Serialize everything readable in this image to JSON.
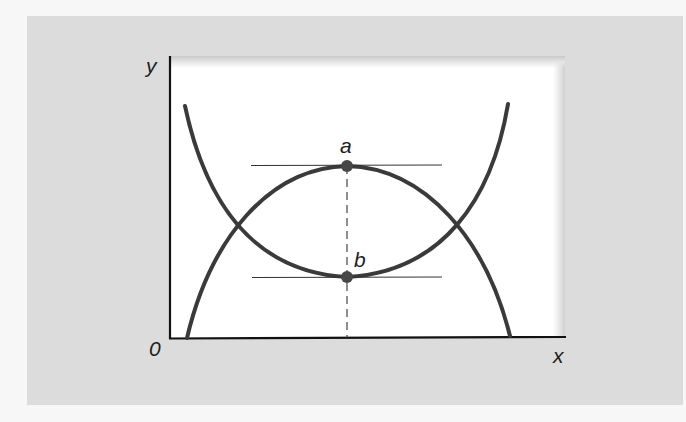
{
  "diagram": {
    "axes": {
      "x_label": "x",
      "y_label": "y",
      "origin_label": "0"
    },
    "curves": [
      {
        "name": "u-shaped-curve",
        "description": "convex curve with minimum at b"
      },
      {
        "name": "inverted-u-curve",
        "description": "concave curve with maximum at a"
      }
    ],
    "points": [
      {
        "label": "a",
        "description": "maximum of concave curve, horizontal tangent"
      },
      {
        "label": "b",
        "description": "minimum of convex curve, horizontal tangent"
      }
    ],
    "annotations": {
      "dashed_line": "vertical dashed line through a and b to x-axis"
    },
    "colors": {
      "curve": "#3a3a3a",
      "axis": "#111111",
      "panel": "#dcdcdc",
      "plot": "#ffffff"
    }
  }
}
